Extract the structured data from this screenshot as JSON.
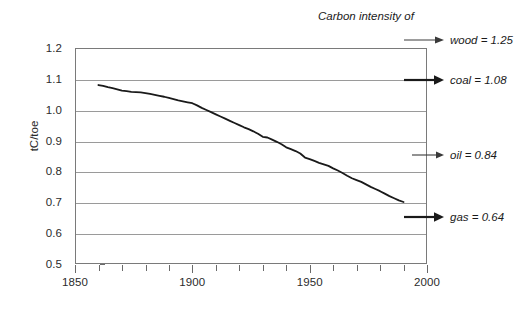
{
  "chart_data": {
    "type": "line",
    "title": "Carbon intensity of",
    "xlabel": "",
    "ylabel": "tC/toe",
    "xlim": [
      1850,
      2000
    ],
    "ylim": [
      0.5,
      1.2
    ],
    "grid": true,
    "legend_position": "right-annotations",
    "x_tick_labels": [
      "1850",
      "1900",
      "1950",
      "2000"
    ],
    "x_tick_values": [
      1850,
      1900,
      1950,
      2000
    ],
    "x_minor_tick_values": [
      1860,
      1870,
      1880,
      1890,
      1910,
      1920,
      1930,
      1940,
      1950,
      1960,
      1970,
      1980,
      1990
    ],
    "y_tick_labels": [
      "1.2",
      "1.1",
      "1.0",
      "0.9",
      "0.8",
      "0.7",
      "0.6",
      "0.5"
    ],
    "y_tick_values": [
      1.2,
      1.1,
      1.0,
      0.9,
      0.8,
      0.7,
      0.6,
      0.5
    ],
    "series": [
      {
        "name": "Carbon intensity of global energy",
        "color": "#1a1a1a",
        "x": [
          1860,
          1862,
          1864,
          1866,
          1868,
          1870,
          1872,
          1874,
          1876,
          1878,
          1880,
          1882,
          1884,
          1886,
          1888,
          1890,
          1892,
          1894,
          1896,
          1898,
          1900,
          1902,
          1904,
          1906,
          1908,
          1910,
          1912,
          1914,
          1916,
          1918,
          1920,
          1922,
          1924,
          1926,
          1928,
          1930,
          1932,
          1934,
          1936,
          1938,
          1940,
          1942,
          1944,
          1946,
          1948,
          1950,
          1952,
          1954,
          1956,
          1958,
          1960,
          1962,
          1964,
          1966,
          1968,
          1970,
          1972,
          1974,
          1976,
          1978,
          1980,
          1982,
          1984,
          1986,
          1988,
          1990
        ],
        "y": [
          1.08,
          1.077,
          1.073,
          1.07,
          1.066,
          1.062,
          1.06,
          1.058,
          1.057,
          1.056,
          1.054,
          1.051,
          1.048,
          1.045,
          1.042,
          1.038,
          1.034,
          1.03,
          1.027,
          1.024,
          1.021,
          1.014,
          1.006,
          0.999,
          0.992,
          0.985,
          0.978,
          0.971,
          0.964,
          0.957,
          0.95,
          0.943,
          0.937,
          0.93,
          0.922,
          0.912,
          0.91,
          0.903,
          0.896,
          0.888,
          0.878,
          0.872,
          0.866,
          0.858,
          0.845,
          0.84,
          0.834,
          0.828,
          0.823,
          0.818,
          0.81,
          0.803,
          0.795,
          0.786,
          0.778,
          0.772,
          0.766,
          0.758,
          0.75,
          0.743,
          0.736,
          0.728,
          0.72,
          0.713,
          0.706,
          0.701
        ]
      }
    ],
    "annotations": [
      {
        "id": "wood",
        "label": "wood = 1.25",
        "value": 1.25,
        "arrow": "thin",
        "y_px": 40
      },
      {
        "id": "coal",
        "label": "coal = 1.08",
        "value": 1.08,
        "arrow": "bold",
        "y_px": 80
      },
      {
        "id": "oil",
        "label": "oil = 0.84",
        "value": 0.84,
        "arrow": "thin",
        "y_px": 155
      },
      {
        "id": "gas",
        "label": "gas = 0.64",
        "value": 0.64,
        "arrow": "bold",
        "y_px": 217
      }
    ]
  },
  "axis": {
    "y_title": "tC/toe",
    "y_labels": [
      "1.2",
      "1.1",
      "1.0",
      "0.9",
      "0.8",
      "0.7",
      "0.6",
      "0.5"
    ],
    "x_labels": [
      "1850",
      "1900",
      "1950",
      "2000"
    ]
  },
  "title": {
    "text": "Carbon intensity of"
  },
  "annotations": {
    "wood": "wood = 1.25",
    "coal": "coal = 1.08",
    "oil": "oil = 0.84",
    "gas": "gas = 0.64"
  },
  "colors": {
    "line": "#1a1a1a",
    "grid": "#9a9a9a",
    "frame": "#7a7a7a",
    "text": "#1a1a1a",
    "background": "#ffffff"
  }
}
